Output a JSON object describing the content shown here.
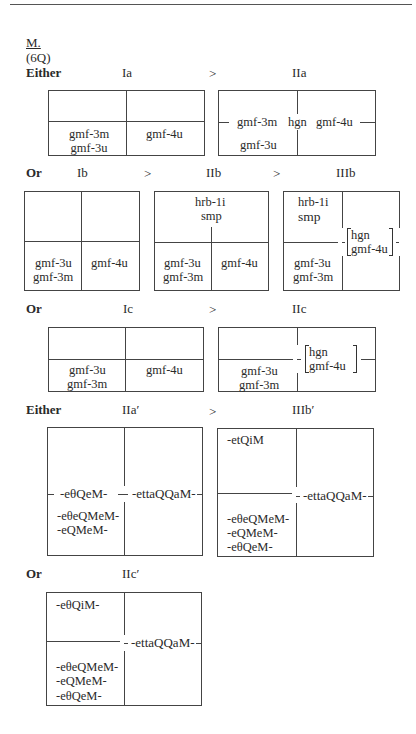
{
  "header": {
    "section_letter": "M.",
    "section_note": "(6Q)"
  },
  "rows": [
    {
      "connector": "Either",
      "stages": [
        "Ia",
        "IIa"
      ],
      "arrows": [
        ">"
      ],
      "boxes": [
        {
          "id": "Ia",
          "cells": {
            "bottom_left": [
              "gmf-3m",
              "gmf-3u"
            ],
            "bottom_right": [
              "gmf-4u"
            ]
          }
        },
        {
          "id": "IIa",
          "cells": {
            "middle_left": "gmf-3m",
            "middle_center": "hgn",
            "middle_right": "gmf-4u",
            "bottom_left": "gmf-3u"
          }
        }
      ]
    },
    {
      "connector": "Or",
      "stages": [
        "Ib",
        "IIb",
        "IIIb"
      ],
      "arrows": [
        ">",
        ">"
      ],
      "boxes": [
        {
          "id": "Ib",
          "cells": {
            "bottom_left": [
              "gmf-3u",
              "gmf-3m"
            ],
            "bottom_right": [
              "gmf-4u"
            ]
          }
        },
        {
          "id": "IIb",
          "cells": {
            "top": [
              "hrb-1i",
              "smp"
            ],
            "bottom_left": [
              "gmf-3u",
              "gmf-3m"
            ],
            "bottom_right": [
              "gmf-4u"
            ]
          }
        },
        {
          "id": "IIIb",
          "cells": {
            "top_left": [
              "hrb-1i",
              "smp"
            ],
            "bottom_left": [
              "gmf-3u",
              "gmf-3m"
            ],
            "right_bracket": [
              "hgn",
              "gmf-4u"
            ]
          }
        }
      ]
    },
    {
      "connector": "Or",
      "stages": [
        "Ic",
        "IIc"
      ],
      "arrows": [
        ">"
      ],
      "boxes": [
        {
          "id": "Ic",
          "cells": {
            "bottom_left": [
              "gmf-3u",
              "gmf-3m"
            ],
            "bottom_right": [
              "gmf-4u"
            ]
          }
        },
        {
          "id": "IIc",
          "cells": {
            "bottom_left": [
              "gmf-3u",
              "gmf-3m"
            ],
            "right_bracket": [
              "hgn",
              "gmf-4u"
            ]
          }
        }
      ]
    },
    {
      "connector": "Either",
      "stages": [
        "IIa′",
        "IIIb′"
      ],
      "arrows": [
        ">"
      ],
      "boxes": [
        {
          "id": "IIa′",
          "cells": {
            "middle_left": "-eθQeM-",
            "middle_right": "-ettaQQaM-",
            "lower_left": [
              "-eθeQMeM-",
              "-eQMeM-"
            ]
          }
        },
        {
          "id": "IIIb′",
          "cells": {
            "top_left": "-etQiM",
            "middle_right": "-ettaQQaM-",
            "bottom_left": [
              "-eθeQMeM-",
              "-eQMeM-",
              "-eθQeM-"
            ]
          }
        }
      ]
    },
    {
      "connector": "Or",
      "stages": [
        "IIc′"
      ],
      "arrows": [],
      "boxes": [
        {
          "id": "IIc′",
          "cells": {
            "top_left": "-eθQiM-",
            "middle_right": "-ettaQQaM-",
            "bottom_left": [
              "-eθeQMeM-",
              "-eQMeM-",
              "-eθQeM-"
            ]
          }
        }
      ]
    }
  ]
}
